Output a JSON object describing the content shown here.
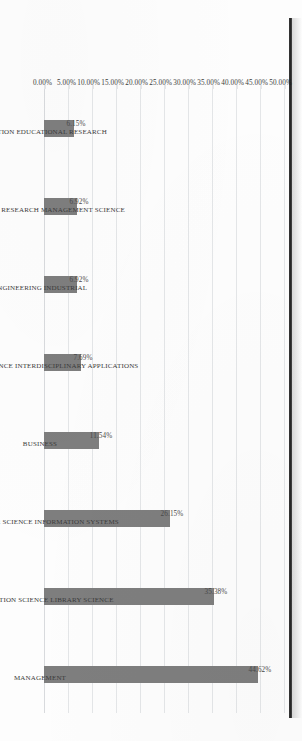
{
  "chart_data": {
    "type": "bar",
    "title": "",
    "subtitle": "",
    "xlabel": "",
    "ylabel": "",
    "orientation": "rotated-90cw",
    "grid": true,
    "legend": "none",
    "ylim": [
      0,
      50
    ],
    "ytick_step": 5,
    "value_format": "percent-2dp",
    "categories": [
      "EDUCATION EDUCATIONAL RESEARCH",
      "OPERATIONS RESEARCH MANAGEMENT SCIENCE",
      "ENGINEERING INDUSTRIAL",
      "COMPUTER SCIENCE INTERDISCIPLINARY APPLICATIONS",
      "BUSINESS",
      "COMPUTER SCIENCE INFORMATION SYSTEMS",
      "INFORMATION SCIENCE LIBRARY SCIENCE",
      "MANAGEMENT"
    ],
    "values": [
      6.15,
      6.92,
      6.92,
      7.69,
      11.54,
      26.15,
      35.38,
      44.62
    ],
    "value_labels": [
      "6.15%",
      "6.92%",
      "6.92%",
      "7.69%",
      "11.54%",
      "26.15%",
      "35.38%",
      "44.62%"
    ],
    "ytick_labels": [
      "0.00%",
      "5.00%",
      "10.00%",
      "15.00%",
      "20.00%",
      "25.00%",
      "30.00%",
      "35.00%",
      "40.00%",
      "45.00%",
      "50.00%"
    ],
    "ytick_values": [
      0,
      5,
      10,
      15,
      20,
      25,
      30,
      35,
      40,
      45,
      50
    ],
    "colors": {
      "bar": "#7e7e7e",
      "gridline": "#e4e6e8",
      "axis_text": "#3b3b3b",
      "value_text": "#4a4a4a",
      "background": "#fdfdfd",
      "scan_edge": "#111111"
    }
  }
}
